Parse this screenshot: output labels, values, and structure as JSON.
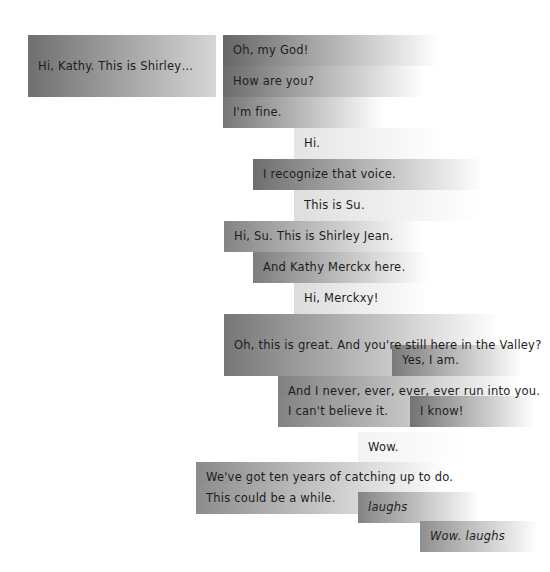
{
  "visualization": {
    "title": "Conversation timeline",
    "type": "gradient-bar-transcript",
    "canvas": {
      "width": 550,
      "height": 572
    },
    "background_color": "#ffffff",
    "text_color": "#1d1d1d",
    "row_height": 31,
    "description": "Overlapping horizontal gradient bars, one per spoken utterance, fading from dark grey at the onset to white as the sound decays."
  },
  "chart_data": {
    "type": "bar",
    "xlabel": "",
    "ylabel": "",
    "grid": false,
    "legend": "none",
    "categories": [
      "Hi, Kathy. This is Shirley…",
      "Oh, my God!",
      "How are you?",
      "I'm fine.",
      "Hi.",
      "I recognize that voice.",
      "This is Su.",
      "Hi, Su. This is Shirley Jean.",
      "And Kathy Merckx here.",
      "Hi, Merckxy!",
      "Oh, this is great. And you're still here in the Valley?",
      "Yes, I am.",
      "And I never, ever, ever, ever run into you.",
      "I can't believe it.",
      "I know!",
      "Wow.",
      "We've got ten years of catching up to do.",
      "This could be a while.",
      "laughs",
      "Wow. laughs"
    ],
    "values": [
      188,
      216,
      200,
      160,
      150,
      230,
      185,
      196,
      175,
      135,
      275,
      130,
      240,
      240,
      124,
      110,
      250,
      250,
      122,
      118
    ]
  },
  "utterances": [
    {
      "id": "u01",
      "text": "Hi, Kathy. This is Shirley…",
      "italic": false,
      "x": 28,
      "y": 35,
      "width": 188,
      "rows": 2,
      "start_color": "#6f6f6f",
      "end_color": "#d6d6d6",
      "fade_stop": "100%"
    },
    {
      "id": "u02",
      "text": "Oh, my God!",
      "italic": false,
      "x": 223,
      "y": 35,
      "width": 216,
      "rows": 1,
      "start_color": "#666666",
      "end_color": "#ffffff",
      "fade_stop": "100%"
    },
    {
      "id": "u03",
      "text": "How are you?",
      "italic": false,
      "x": 223,
      "y": 66,
      "width": 200,
      "rows": 1,
      "start_color": "#6b6b6b",
      "end_color": "#ffffff",
      "fade_stop": "100%"
    },
    {
      "id": "u04",
      "text": "I'm fine.",
      "italic": false,
      "x": 223,
      "y": 97,
      "width": 160,
      "rows": 1,
      "start_color": "#767676",
      "end_color": "#ffffff",
      "fade_stop": "100%"
    },
    {
      "id": "u05",
      "text": "Hi.",
      "italic": false,
      "x": 294,
      "y": 128,
      "width": 150,
      "rows": 1,
      "start_color": "#e4e4e4",
      "end_color": "#ffffff",
      "fade_stop": "100%"
    },
    {
      "id": "u06",
      "text": "I recognize that voice.",
      "italic": false,
      "x": 253,
      "y": 159,
      "width": 230,
      "rows": 1,
      "start_color": "#6e6e6e",
      "end_color": "#ffffff",
      "fade_stop": "100%"
    },
    {
      "id": "u07",
      "text": "This is Su.",
      "italic": false,
      "x": 294,
      "y": 190,
      "width": 185,
      "rows": 1,
      "start_color": "#dedede",
      "end_color": "#ffffff",
      "fade_stop": "100%"
    },
    {
      "id": "u08",
      "text": "Hi, Su. This is Shirley Jean.",
      "italic": false,
      "x": 224,
      "y": 221,
      "width": 196,
      "rows": 1,
      "start_color": "#848484",
      "end_color": "#ffffff",
      "fade_stop": "100%"
    },
    {
      "id": "u09",
      "text": "And Kathy Merckx here.",
      "italic": false,
      "x": 253,
      "y": 252,
      "width": 175,
      "rows": 1,
      "start_color": "#7d7d7d",
      "end_color": "#ffffff",
      "fade_stop": "100%"
    },
    {
      "id": "u10",
      "text": "Hi, Merckxy!",
      "italic": false,
      "x": 294,
      "y": 283,
      "width": 135,
      "rows": 1,
      "start_color": "#dcdcdc",
      "end_color": "#ffffff",
      "fade_stop": "100%"
    },
    {
      "id": "u11",
      "text": "Oh, this is great. And you're still here in the Valley?",
      "italic": false,
      "x": 224,
      "y": 314,
      "width": 275,
      "rows": 2,
      "start_color": "#767676",
      "end_color": "#ffffff",
      "fade_stop": "100%"
    },
    {
      "id": "u12",
      "text": "Yes, I am.",
      "italic": false,
      "x": 392,
      "y": 345,
      "width": 130,
      "rows": 1,
      "start_color": "#7a7a7a",
      "end_color": "#ffffff",
      "fade_stop": "100%"
    },
    {
      "id": "u13",
      "text": "And I never, ever, ever, ever run into you.",
      "italic": false,
      "x": 278,
      "y": 376,
      "width": 240,
      "rows": 1,
      "start_color": "#808080",
      "end_color": "#ffffff",
      "fade_stop": "100%"
    },
    {
      "id": "u14",
      "text": "I can't believe it.",
      "italic": false,
      "x": 278,
      "y": 396,
      "width": 240,
      "rows": 1,
      "start_color": "#828282",
      "end_color": "#ffffff",
      "fade_stop": "100%"
    },
    {
      "id": "u15",
      "text": "I know!",
      "italic": false,
      "x": 410,
      "y": 396,
      "width": 124,
      "rows": 1,
      "start_color": "#737373",
      "end_color": "#ffffff",
      "fade_stop": "100%"
    },
    {
      "id": "u16",
      "text": "Wow.",
      "italic": false,
      "x": 358,
      "y": 432,
      "width": 110,
      "rows": 1,
      "start_color": "#f3f3f3",
      "end_color": "#ffffff",
      "fade_stop": "100%"
    },
    {
      "id": "u17",
      "text": "We've got ten years of catching up to do.",
      "italic": false,
      "x": 196,
      "y": 462,
      "width": 250,
      "rows": 1,
      "start_color": "#8a8a8a",
      "end_color": "#ffffff",
      "fade_stop": "100%"
    },
    {
      "id": "u18",
      "text": "This could be a while.",
      "italic": false,
      "x": 196,
      "y": 483,
      "width": 250,
      "rows": 1,
      "start_color": "#8c8c8c",
      "end_color": "#ffffff",
      "fade_stop": "100%"
    },
    {
      "id": "u19",
      "text": "laughs",
      "italic": true,
      "x": 358,
      "y": 492,
      "width": 122,
      "rows": 1,
      "start_color": "#848484",
      "end_color": "#ffffff",
      "fade_stop": "100%"
    },
    {
      "id": "u20",
      "text": "Wow. laughs",
      "italic": true,
      "x": 420,
      "y": 521,
      "width": 118,
      "rows": 1,
      "start_color": "#8e8e8e",
      "end_color": "#ffffff",
      "fade_stop": "100%"
    }
  ]
}
